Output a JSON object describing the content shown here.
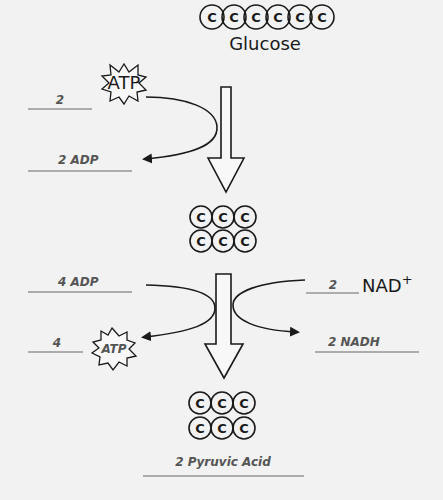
{
  "diagram": {
    "glucose": {
      "label": "Glucose",
      "carbons": [
        "C",
        "C",
        "C",
        "C",
        "C",
        "C"
      ]
    },
    "intermediate": {
      "rows": [
        [
          "C",
          "C",
          "C"
        ],
        [
          "C",
          "C",
          "C"
        ]
      ]
    },
    "product": {
      "rows": [
        [
          "C",
          "C",
          "C"
        ],
        [
          "C",
          "C",
          "C"
        ]
      ],
      "label": "2 Pyruvic Acid"
    },
    "step1": {
      "atp_in_count": "2",
      "atp_in_label": "ATP",
      "adp_out_label": "2 ADP"
    },
    "step2": {
      "adp_in_label": "4 ADP",
      "atp_out_count": "4",
      "atp_out_label": "ATP",
      "nad_in_count": "2",
      "nad_in_label": "NAD",
      "nad_in_superscript": "+",
      "nadh_out_label": "2 NADH"
    },
    "colors": {
      "background": "#f2f2f2",
      "stroke": "#1a1a1a",
      "label_text": "#555555",
      "rule_line": "#666666"
    }
  }
}
